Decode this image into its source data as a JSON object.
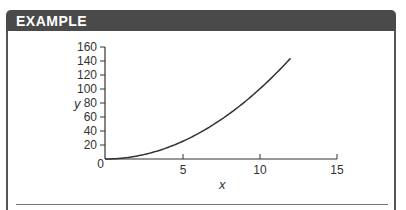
{
  "header": {
    "title": "EXAMPLE"
  },
  "colors": {
    "header_bg": "#4a4a4a",
    "header_text": "#ffffff",
    "curve": "#333333",
    "axis": "#333333"
  },
  "chart_data": {
    "type": "line",
    "title": "",
    "xlabel": "x",
    "ylabel": "y",
    "xlim": [
      0,
      15
    ],
    "ylim": [
      0,
      160
    ],
    "x_ticks": [
      0,
      5,
      10,
      15
    ],
    "y_ticks": [
      0,
      20,
      40,
      60,
      80,
      100,
      120,
      140,
      160
    ],
    "grid": false,
    "legend": null,
    "series": [
      {
        "name": "y = x^2",
        "x": [
          0,
          1,
          2,
          3,
          4,
          5,
          6,
          7,
          8,
          9,
          10,
          11,
          12
        ],
        "values": [
          0,
          1,
          4,
          9,
          16,
          25,
          36,
          49,
          64,
          81,
          100,
          121,
          144
        ]
      }
    ]
  },
  "axis_labels": {
    "x": "x",
    "y": "y",
    "origin": "0",
    "xt5": "5",
    "xt10": "10",
    "xt15": "15",
    "y20": "20",
    "y40": "40",
    "y60": "60",
    "y80": "80",
    "y100": "100",
    "y120": "120",
    "y140": "140",
    "y160": "160"
  }
}
